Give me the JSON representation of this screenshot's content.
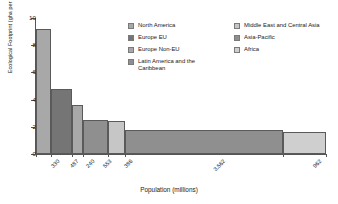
{
  "chart_data": {
    "type": "bar",
    "title": "",
    "subtitle": "",
    "xlabel": "Population (millions)",
    "ylabel": "Ecological Footprint (gha per person)",
    "ylim": [
      0,
      10
    ],
    "yticks": [
      0,
      2,
      4,
      6,
      8,
      10
    ],
    "grid": false,
    "legend_position": "top-right",
    "variable_width": true,
    "width_unit": "millions of people",
    "height_unit": "gha per person",
    "categories": [
      "North America",
      "Europe EU",
      "Europe Non-EU",
      "Latin America and the Caribbean",
      "Middle East and Central Asia",
      "Asia-Pacific",
      "Africa"
    ],
    "xticklabels": [
      "330",
      "487",
      "240",
      "553",
      "386",
      "3,562",
      "962"
    ],
    "populations": [
      330,
      487,
      240,
      553,
      386,
      3562,
      962
    ],
    "values": [
      9.2,
      4.75,
      3.6,
      2.5,
      2.4,
      1.75,
      1.6
    ],
    "colors": [
      "#a8a8a8",
      "#757575",
      "#a8a8a8",
      "#8f8f8f",
      "#c6c6c6",
      "#8f8f8f",
      "#cfcfcf"
    ]
  },
  "axes": {
    "y_title": "Ecological Footprint (gha per person)",
    "x_title": "Population (millions)",
    "y_ticks": [
      {
        "label": "10",
        "value": 10
      },
      {
        "label": "8",
        "value": 8
      },
      {
        "label": "6",
        "value": 6
      },
      {
        "label": "4",
        "value": 4
      },
      {
        "label": "2",
        "value": 2
      },
      {
        "label": "0",
        "value": 0
      }
    ],
    "x_ticks": [
      {
        "label": "330"
      },
      {
        "label": "487"
      },
      {
        "label": "240"
      },
      {
        "label": "553"
      },
      {
        "label": "386"
      },
      {
        "label": "3,562"
      },
      {
        "label": "962"
      }
    ]
  },
  "legend": {
    "columns": [
      {
        "items": [
          {
            "label": "North America",
            "color": "#a8a8a8"
          },
          {
            "label": "Europe EU",
            "color": "#757575"
          },
          {
            "label": "Europe Non-EU",
            "color": "#a8a8a8"
          },
          {
            "label": "Latin America and the Caribbean",
            "color": "#8f8f8f"
          }
        ]
      },
      {
        "items": [
          {
            "label": "Middle East and Central Asia",
            "color": "#c6c6c6"
          },
          {
            "label": "Asia-Pacific",
            "color": "#8f8f8f"
          },
          {
            "label": "Africa",
            "color": "#cfcfcf"
          }
        ]
      }
    ]
  }
}
